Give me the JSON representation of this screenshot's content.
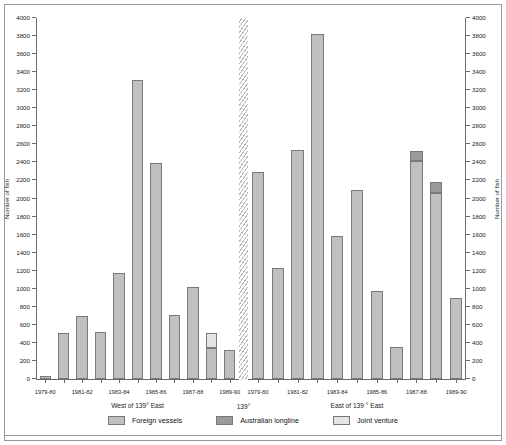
{
  "chart_data": {
    "type": "bar",
    "title": "",
    "xlabel": "",
    "ylabel": "Number of fish",
    "ylabel_right": "Number of fish",
    "ylim": [
      0,
      4000
    ],
    "ytick_step": 200,
    "yticks": [
      0,
      200,
      400,
      600,
      800,
      1000,
      1200,
      1400,
      1600,
      1800,
      2000,
      2200,
      2400,
      2600,
      2800,
      3000,
      3200,
      3400,
      3600,
      3800,
      4000
    ],
    "grid": false,
    "legend_position": "bottom",
    "stacked": true,
    "series": [
      {
        "name": "Foreign vessels",
        "color": "#c0c0c0"
      },
      {
        "name": "Australian longline",
        "color": "#9a9a9a"
      },
      {
        "name": "Joint venture",
        "color": "#e4e4e4"
      }
    ],
    "panels": [
      {
        "name": "west",
        "title": "West of 139° East",
        "categories": [
          "1979-80",
          "1980-81",
          "1981-82",
          "1982-83",
          "1983-84",
          "1984-85",
          "1985-86",
          "1986-87",
          "1987-88",
          "1988-89",
          "1989-90"
        ],
        "tick_labels": [
          "1979-80",
          "",
          "1981-82",
          "",
          "1983-84",
          "",
          "1985-86",
          "",
          "1987-88",
          "",
          "1989-90"
        ],
        "values": {
          "Foreign vessels": [
            30,
            510,
            700,
            520,
            1180,
            3310,
            2390,
            710,
            1020,
            345,
            325
          ],
          "Australian longline": [
            0,
            0,
            0,
            0,
            0,
            0,
            0,
            0,
            0,
            0,
            0
          ],
          "Joint venture": [
            0,
            0,
            0,
            0,
            0,
            0,
            0,
            0,
            0,
            160,
            0
          ]
        },
        "totals": [
          30,
          510,
          700,
          520,
          1180,
          3310,
          2390,
          710,
          1020,
          505,
          325
        ]
      },
      {
        "name": "east",
        "title": "East of 139 ° East",
        "categories": [
          "1979-80",
          "1980-81",
          "1981-82",
          "1982-83",
          "1983-84",
          "1984-85",
          "1985-86",
          "1986-87",
          "1987-88",
          "1988-89",
          "1989-90"
        ],
        "tick_labels": [
          "1979-80",
          "",
          "1981-82",
          "",
          "1983-84",
          "",
          "1985-86",
          "",
          "1987-88",
          "",
          "1989-90"
        ],
        "values": {
          "Foreign vessels": [
            2290,
            1230,
            2540,
            3820,
            1590,
            2090,
            975,
            360,
            2420,
            2065,
            900
          ],
          "Australian longline": [
            0,
            0,
            0,
            0,
            0,
            0,
            0,
            0,
            110,
            115,
            0
          ],
          "Joint venture": [
            0,
            0,
            0,
            0,
            0,
            0,
            0,
            0,
            0,
            0,
            0
          ]
        },
        "totals": [
          2290,
          1230,
          2540,
          3820,
          1590,
          2090,
          975,
          360,
          2530,
          2180,
          900
        ]
      }
    ],
    "divider_label": "139°"
  },
  "legend": {
    "items": [
      {
        "label": "Foreign vessels",
        "color": "#c0c0c0"
      },
      {
        "label": "Australian longline",
        "color": "#9a9a9a"
      },
      {
        "label": "Joint venture",
        "color": "#e4e4e4"
      }
    ]
  }
}
